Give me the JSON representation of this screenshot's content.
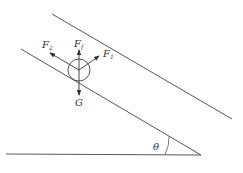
{
  "diagram": {
    "type": "force-diagram-incline",
    "colors": {
      "line": "#444444",
      "background": "#ffffff"
    },
    "labels": {
      "force_up_slope": {
        "main": "F",
        "sub": "2"
      },
      "force_vertical": {
        "main": "F",
        "sub": "f"
      },
      "force_normal": {
        "main": "F",
        "sub": "1"
      },
      "gravity": "G",
      "angle": "θ"
    },
    "elements": {
      "upper_incline": {
        "x1": 52,
        "y1": 14,
        "x2": 232,
        "y2": 119
      },
      "lower_incline": {
        "x1": 21,
        "y1": 49,
        "x2": 201,
        "y2": 155
      },
      "ground": {
        "x1": 6,
        "y1": 154,
        "x2": 201,
        "y2": 155
      },
      "ball": {
        "cx": 79,
        "cy": 70,
        "r": 11
      }
    }
  }
}
